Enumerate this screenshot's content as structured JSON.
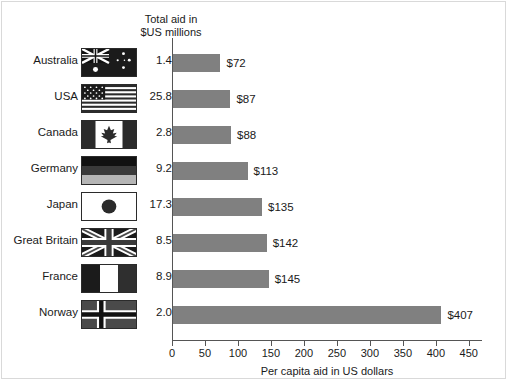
{
  "header": {
    "column_title_line1": "Total aid in",
    "column_title_line2": "$US millions"
  },
  "chart_data": {
    "type": "bar",
    "orientation": "horizontal",
    "title": "",
    "xlabel": "Per capita aid in US dollars",
    "ylabel": "",
    "xlim": [
      0,
      470
    ],
    "xticks": [
      0,
      50,
      100,
      150,
      200,
      250,
      300,
      350,
      400,
      450
    ],
    "xtick_labels": [
      "0",
      "50",
      "100",
      "150",
      "200",
      "250",
      "300",
      "350",
      "400",
      "450"
    ],
    "grid": false,
    "legend": "none",
    "bar_color": "#808080",
    "categories": [
      "Australia",
      "USA",
      "Canada",
      "Germany",
      "Japan",
      "Great Britain",
      "France",
      "Norway"
    ],
    "values": [
      72,
      87,
      88,
      113,
      135,
      142,
      145,
      407
    ],
    "value_labels": [
      "$72",
      "$87",
      "$88",
      "$113",
      "$135",
      "$142",
      "$145",
      "$407"
    ],
    "secondary_series": {
      "name": "Total aid in $US millions",
      "values": [
        1.4,
        25.8,
        2.8,
        9.2,
        17.3,
        8.5,
        8.9,
        2.0
      ],
      "labels": [
        "1.4",
        "25.8",
        "2.8",
        "9.2",
        "17.3",
        "8.5",
        "8.9",
        "2.0"
      ]
    }
  },
  "rows": [
    {
      "country": "Australia",
      "flag": "flag-australia",
      "aid": "1.4",
      "bar_label": "$72",
      "value": 72
    },
    {
      "country": "USA",
      "flag": "flag-usa",
      "aid": "25.8",
      "bar_label": "$87",
      "value": 87
    },
    {
      "country": "Canada",
      "flag": "flag-canada",
      "aid": "2.8",
      "bar_label": "$88",
      "value": 88
    },
    {
      "country": "Germany",
      "flag": "flag-germany",
      "aid": "9.2",
      "bar_label": "$113",
      "value": 113
    },
    {
      "country": "Japan",
      "flag": "flag-japan",
      "aid": "17.3",
      "bar_label": "$135",
      "value": 135
    },
    {
      "country": "Great Britain",
      "flag": "flag-great-britain",
      "aid": "8.5",
      "bar_label": "$142",
      "value": 142
    },
    {
      "country": "France",
      "flag": "flag-france",
      "aid": "8.9",
      "bar_label": "$145",
      "value": 145
    },
    {
      "country": "Norway",
      "flag": "flag-norway",
      "aid": "2.0",
      "bar_label": "$407",
      "value": 407
    }
  ]
}
